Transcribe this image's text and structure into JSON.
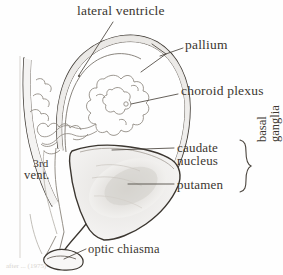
{
  "figure": {
    "kind": "anatomical-line-drawing",
    "background_color": "#fefefe",
    "ink_color": "#3b3630",
    "credit": "after ... (1975)"
  },
  "labels": {
    "lateral_ventricle": "lateral ventricle",
    "pallium": "pallium",
    "choroid_plexus": "choroid plexus",
    "caudate_nucleus_line1": "caudate",
    "caudate_nucleus_line2": "nucleus",
    "putamen": "putamen",
    "optic_chiasma": "optic chiasma",
    "third_ventricle_line1": "3rd",
    "third_ventricle_line2": "vent.",
    "basal_ganglia_line1": "basal",
    "basal_ganglia_line2": "ganglia"
  }
}
